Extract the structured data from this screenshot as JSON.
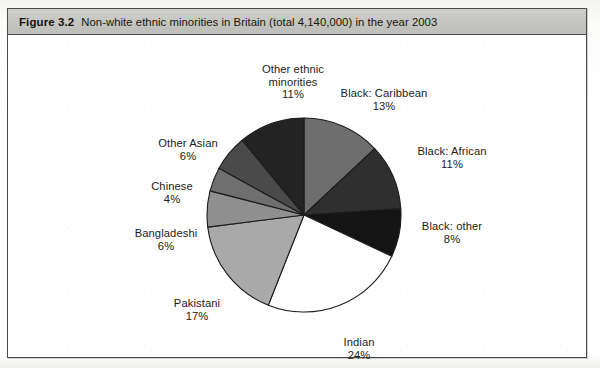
{
  "figure": {
    "number_label": "Figure 3.2",
    "caption": "Non-white ethnic minorities in Britain (total 4,140,000) in the year 2003"
  },
  "chart_data": {
    "type": "pie",
    "title": "Non-white ethnic minorities in Britain (total 4,140,000) in the year 2003",
    "total_label": "total 4,140,000",
    "year": "2003",
    "units": "percent",
    "legend": "none",
    "labels_position": "outside-callout",
    "start_angle_deg": 0,
    "direction": "clockwise",
    "categories": [
      "Black: Caribbean",
      "Black: African",
      "Black: other",
      "Indian",
      "Pakistani",
      "Bangladeshi",
      "Chinese",
      "Other Asian",
      "Other ethnic minorities"
    ],
    "values": [
      13,
      11,
      8,
      24,
      17,
      6,
      4,
      6,
      11
    ],
    "slices": [
      {
        "name": "Black: Caribbean",
        "value": 13,
        "pct_label": "13%",
        "color": "#6e6e6e"
      },
      {
        "name": "Black: African",
        "value": 11,
        "pct_label": "11%",
        "color": "#2f2f2f"
      },
      {
        "name": "Black: other",
        "value": 8,
        "pct_label": "8%",
        "color": "#141414"
      },
      {
        "name": "Indian",
        "value": 24,
        "pct_label": "24%",
        "color": "#ffffff"
      },
      {
        "name": "Pakistani",
        "value": 17,
        "pct_label": "17%",
        "color": "#a9a9a9"
      },
      {
        "name": "Bangladeshi",
        "value": 6,
        "pct_label": "6%",
        "color": "#8f8f8f"
      },
      {
        "name": "Chinese",
        "value": 4,
        "pct_label": "4%",
        "color": "#6f6f6f"
      },
      {
        "name": "Other Asian",
        "value": 6,
        "pct_label": "6%",
        "color": "#4a4a4a"
      },
      {
        "name": "Other ethnic minorities",
        "value": 11,
        "pct_label": "11%",
        "color": "#232323"
      }
    ]
  },
  "labels": [
    {
      "name": "Other ethnic minorities",
      "pct": "11%",
      "line1": "Other ethnic",
      "line2": "minorities",
      "x": 230,
      "y": 28,
      "w": 110
    },
    {
      "name": "Black: Caribbean",
      "pct": "13%",
      "line1": "Black: Caribbean",
      "line2": "",
      "x": 316,
      "y": 52,
      "w": 120
    },
    {
      "name": "Black: African",
      "pct": "11%",
      "line1": "Black: African",
      "line2": "",
      "x": 392,
      "y": 110,
      "w": 104
    },
    {
      "name": "Black: other",
      "pct": "8%",
      "line1": "Black: other",
      "line2": "",
      "x": 396,
      "y": 185,
      "w": 96
    },
    {
      "name": "Indian",
      "pct": "24%",
      "line1": "Indian",
      "line2": "",
      "x": 318,
      "y": 301,
      "w": 66
    },
    {
      "name": "Pakistani",
      "pct": "17%",
      "line1": "Pakistani",
      "line2": "",
      "x": 148,
      "y": 262,
      "w": 82
    },
    {
      "name": "Bangladeshi",
      "pct": "6%",
      "line1": "Bangladeshi",
      "line2": "",
      "x": 112,
      "y": 192,
      "w": 92
    },
    {
      "name": "Chinese",
      "pct": "4%",
      "line1": "Chinese",
      "line2": "",
      "x": 128,
      "y": 145,
      "w": 72
    },
    {
      "name": "Other Asian",
      "pct": "6%",
      "line1": "Other Asian",
      "line2": "",
      "x": 134,
      "y": 102,
      "w": 92
    }
  ],
  "geometry": {
    "center_x": 296,
    "center_y": 180,
    "radius": 97
  }
}
